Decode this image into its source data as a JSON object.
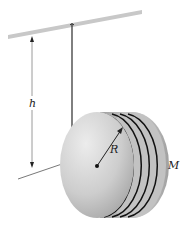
{
  "diagram": {
    "labels": {
      "height": "h",
      "radius": "R",
      "mass": "M"
    },
    "colors": {
      "ceiling": "#c8c8c8",
      "string": "#2a2a2a",
      "dimension_line": "#9a9a9a",
      "disk_face_light": "#e4e4e4",
      "disk_face_dark": "#a8a8a8",
      "disk_rim": "#b5b5b5",
      "groove": "#111111",
      "label": "#222222"
    },
    "grooves": 4
  }
}
